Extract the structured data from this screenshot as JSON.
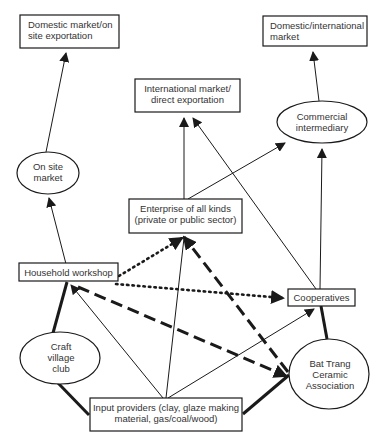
{
  "colors": {
    "stroke": "#1a1a1a",
    "text": "#333333",
    "background": "#ffffff"
  },
  "nodes": {
    "domestic_onsite": {
      "shape": "box",
      "lines": [
        "Domestic market/on",
        "site exportation"
      ]
    },
    "domestic_international": {
      "shape": "box",
      "lines": [
        "Domestic/international",
        "market"
      ]
    },
    "international_direct": {
      "shape": "box",
      "lines": [
        "International market/",
        "direct exportation"
      ]
    },
    "commercial_intermediary": {
      "shape": "ellipse",
      "lines": [
        "Commercial",
        "intermediary"
      ]
    },
    "on_site_market": {
      "shape": "ellipse",
      "lines": [
        "On site",
        "market"
      ]
    },
    "enterprise": {
      "shape": "box",
      "lines": [
        "Enterprise of all kinds",
        "(private or public sector)"
      ]
    },
    "household_workshop": {
      "shape": "box",
      "lines": [
        "Household workshop"
      ]
    },
    "cooperatives": {
      "shape": "box",
      "lines": [
        "Cooperatives"
      ]
    },
    "craft_village_club": {
      "shape": "ellipse",
      "lines": [
        "Craft",
        "village",
        "club"
      ]
    },
    "bat_trang_association": {
      "shape": "ellipse",
      "lines": [
        "Bat Trang",
        "Ceramic",
        "Association"
      ]
    },
    "input_providers": {
      "shape": "box",
      "lines": [
        "Input providers (clay, glaze making",
        "material, gas/coal/wood)"
      ]
    }
  },
  "edges": [
    {
      "from": "on_site_market",
      "to": "domestic_onsite",
      "style": "thin",
      "arrow": true
    },
    {
      "from": "household_workshop",
      "to": "on_site_market",
      "style": "thin",
      "arrow": true
    },
    {
      "from": "enterprise",
      "to": "international_direct",
      "style": "thin",
      "arrow": true
    },
    {
      "from": "enterprise",
      "to": "commercial_intermediary",
      "style": "thin",
      "arrow": true
    },
    {
      "from": "commercial_intermediary",
      "to": "domestic_international",
      "style": "thin",
      "arrow": true
    },
    {
      "from": "cooperatives",
      "to": "international_direct",
      "style": "thin",
      "arrow": true
    },
    {
      "from": "cooperatives",
      "to": "commercial_intermediary",
      "style": "thin",
      "arrow": true
    },
    {
      "from": "household_workshop",
      "to": "enterprise",
      "style": "dotted",
      "arrow": true
    },
    {
      "from": "household_workshop",
      "to": "cooperatives",
      "style": "dotted",
      "arrow": true
    },
    {
      "from": "bat_trang_association",
      "to": "enterprise",
      "style": "dashed",
      "arrow": true
    },
    {
      "from": "household_workshop",
      "to": "bat_trang_association",
      "style": "dashed",
      "arrow": true
    },
    {
      "from": "input_providers",
      "to": "household_workshop",
      "style": "thin",
      "arrow": true
    },
    {
      "from": "input_providers",
      "to": "enterprise",
      "style": "thin",
      "arrow": false
    },
    {
      "from": "input_providers",
      "to": "cooperatives",
      "style": "thin",
      "arrow": true
    },
    {
      "from": "craft_village_club",
      "to": "household_workshop",
      "style": "thick",
      "arrow": false
    },
    {
      "from": "craft_village_club",
      "to": "input_providers",
      "style": "thick",
      "arrow": false
    },
    {
      "from": "bat_trang_association",
      "to": "cooperatives",
      "style": "thick",
      "arrow": false
    },
    {
      "from": "bat_trang_association",
      "to": "input_providers",
      "style": "thick",
      "arrow": false
    }
  ]
}
